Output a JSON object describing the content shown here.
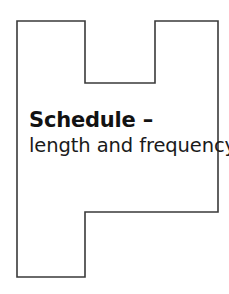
{
  "page": {
    "background_color": "#ffffff",
    "width": 229,
    "height": 294
  },
  "chapter_marker": {
    "shape_name": "stepped-polygon-outline",
    "stroke_color": "#3a3a3a",
    "fill_color": "#ffffff",
    "stroke_width": 1.6,
    "outline_points": "17,21 85,21 85,83 155,83 155,21 218,21 218,212 85,212 85,277 17,277",
    "bounds": {
      "left": 17,
      "top": 21,
      "right": 218,
      "bottom": 277
    },
    "notches": {
      "top_notch": {
        "x_start": 85,
        "x_end": 155,
        "depth_y": 83
      },
      "bottom_notch": {
        "x_start": 85,
        "x_end": 218,
        "step_y": 212
      }
    }
  },
  "title": {
    "line_primary": "Schedule –",
    "line_secondary": "length and frequency",
    "text_color": "#121212"
  }
}
